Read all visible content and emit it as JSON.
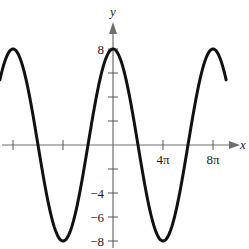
{
  "chart_data": {
    "type": "line",
    "title": "",
    "xlabel": "x",
    "ylabel": "y",
    "function": "y = 8 cos(x/4)",
    "series": [
      {
        "name": "curve",
        "x_units_pi": [
          -9,
          -8,
          -6,
          -4,
          -2,
          0,
          2,
          4,
          6,
          8,
          9
        ],
        "values": [
          5.66,
          8,
          0,
          -8,
          0,
          8,
          0,
          -8,
          0,
          8,
          5.66
        ]
      }
    ],
    "x_ticks": [
      {
        "value_pi": -8,
        "label": ""
      },
      {
        "value_pi": -4,
        "label": ""
      },
      {
        "value_pi": 4,
        "label": "4π"
      },
      {
        "value_pi": 8,
        "label": "8π"
      }
    ],
    "y_ticks": [
      {
        "value": 8,
        "label": "8"
      },
      {
        "value": 6,
        "label": ""
      },
      {
        "value": 4,
        "label": ""
      },
      {
        "value": 2,
        "label": ""
      },
      {
        "value": -2,
        "label": ""
      },
      {
        "value": -4,
        "label": "−4"
      },
      {
        "value": -6,
        "label": "−6"
      },
      {
        "value": -8,
        "label": "−8"
      }
    ],
    "xlim_pi": [
      -9,
      10
    ],
    "ylim": [
      -8.5,
      10
    ],
    "grid": false,
    "legend": null
  },
  "labels": {
    "x_axis": "x",
    "y_axis": "y"
  },
  "colors": {
    "curve": "#111111",
    "axis": "#6e6e6e"
  }
}
